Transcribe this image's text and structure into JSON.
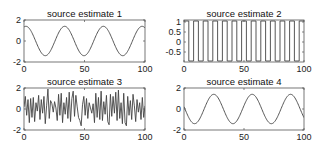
{
  "chart_data": [
    {
      "type": "line",
      "title": "source estimate 1",
      "xlabel": "",
      "ylabel": "",
      "xlim": [
        0,
        100
      ],
      "ylim": [
        -2,
        2
      ],
      "xticks": [
        0,
        50,
        100
      ],
      "yticks": [
        -2,
        0,
        2
      ],
      "grid": false,
      "signal": {
        "kind": "sine",
        "amplitude": 1.4,
        "period": 32,
        "phase_deg": 72
      },
      "box": {
        "x": 24,
        "y": 20,
        "w": 121,
        "h": 42
      }
    },
    {
      "type": "line",
      "title": "source estimate 2",
      "xlabel": "",
      "ylabel": "",
      "xlim": [
        0,
        100
      ],
      "ylim": [
        -1,
        1.1
      ],
      "xticks": [
        0,
        50,
        100
      ],
      "yticks": [
        -0.5,
        0,
        0.5,
        1
      ],
      "grid": false,
      "signal": {
        "kind": "square",
        "high": 1.05,
        "low": -0.95,
        "period": 8,
        "offset": 0
      },
      "box": {
        "x": 184,
        "y": 20,
        "w": 120,
        "h": 42
      }
    },
    {
      "type": "line",
      "title": "source estimate 3",
      "xlabel": "",
      "ylabel": "",
      "xlim": [
        0,
        100
      ],
      "ylim": [
        -2,
        2
      ],
      "xticks": [
        0,
        50,
        100
      ],
      "yticks": [
        -2,
        0,
        2
      ],
      "grid": false,
      "signal": {
        "kind": "samples",
        "values": [
          0.2,
          1.2,
          -0.6,
          0.9,
          -1.3,
          1.0,
          -0.8,
          1.1,
          -1.2,
          0.6,
          -0.2,
          1.3,
          -1.0,
          0.9,
          -0.4,
          1.2,
          -1.4,
          0.3,
          1.9,
          -0.9,
          0.8,
          0.5,
          -0.3,
          0.7,
          0.1,
          -1.1,
          1.4,
          -0.6,
          1.5,
          -1.3,
          0.6,
          -0.5,
          1.1,
          -0.9,
          1.6,
          -1.2,
          1.0,
          1.7,
          -0.7,
          1.3,
          0.2,
          -0.8,
          -1.1,
          -1.6,
          0.4,
          1.2,
          -0.6,
          1.0,
          -0.9,
          0.6,
          0.1,
          -0.4,
          0.5,
          -1.3,
          1.5,
          -0.8,
          1.1,
          -1.0,
          1.7,
          -1.1,
          0.7,
          -0.5,
          1.3,
          -1.2,
          -1.5,
          1.4,
          -0.7,
          1.2,
          -0.4,
          1.6,
          -1.1,
          1.8,
          -0.9,
          0.6,
          -1.4,
          1.5,
          -1.3,
          -1.6,
          1.2,
          -0.6,
          0.8,
          -1.0,
          1.4,
          0.3,
          -1.2,
          0.9,
          -0.3,
          0.6,
          -1.0,
          1.1,
          -0.8,
          0.3
        ]
      },
      "box": {
        "x": 24,
        "y": 88,
        "w": 121,
        "h": 42
      }
    },
    {
      "type": "line",
      "title": "source estimate 4",
      "xlabel": "",
      "ylabel": "",
      "xlim": [
        0,
        100
      ],
      "ylim": [
        -2,
        2
      ],
      "xticks": [
        0,
        50,
        100
      ],
      "yticks": [
        -2,
        0,
        2
      ],
      "grid": false,
      "signal": {
        "kind": "sine",
        "amplitude": 1.4,
        "period": 32,
        "phase_deg": 171
      },
      "box": {
        "x": 184,
        "y": 88,
        "w": 120,
        "h": 42
      }
    }
  ],
  "style": {
    "line_color": "#444444",
    "axis_color": "#555555",
    "text_color": "#111111"
  }
}
